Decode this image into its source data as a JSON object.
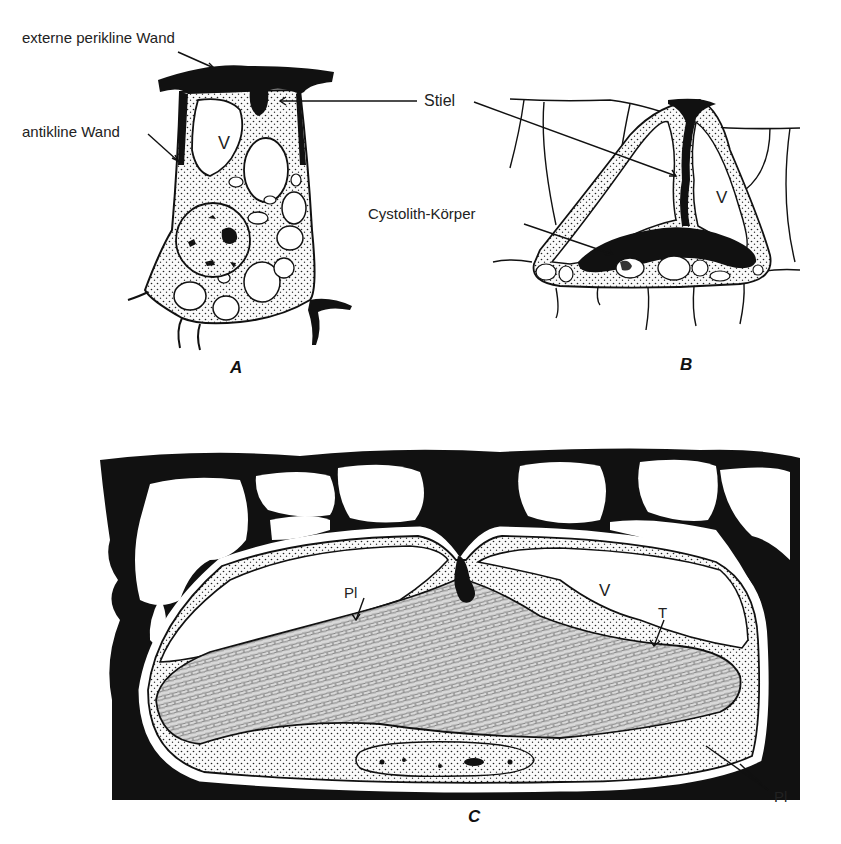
{
  "figure": {
    "panels": [
      {
        "id": "A",
        "label": "A"
      },
      {
        "id": "B",
        "label": "B"
      },
      {
        "id": "C",
        "label": "C"
      }
    ],
    "labels": {
      "external_periclinal_wall": "externe perikline Wand",
      "anticlinal_wall": "antikline Wand",
      "stalk": "Stiel",
      "cystolith_body": "Cystolith-Körper",
      "vacuole_A": "V",
      "vacuole_B": "V",
      "vacuole_C": "V",
      "plasmalemma_1": "Pl",
      "tonoplast": "T",
      "plasmalemma_2": "Pl"
    },
    "colors": {
      "ink": "#111111",
      "background": "#ffffff",
      "cytoplasm": "#f2f2f2"
    }
  }
}
